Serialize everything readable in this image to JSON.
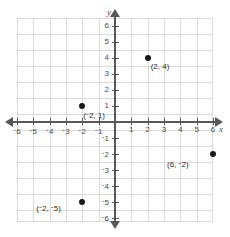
{
  "figure": {
    "type": "coordinate-plane",
    "x_axis_name": "x",
    "y_axis_name": "y"
  },
  "axes": {
    "x_ticks": [
      {
        "value": -6,
        "label": "6",
        "negative": true
      },
      {
        "value": -5,
        "label": "5",
        "negative": true
      },
      {
        "value": -4,
        "label": "4",
        "negative": true
      },
      {
        "value": -3,
        "label": "3",
        "negative": true
      },
      {
        "value": -2,
        "label": "2",
        "negative": true
      },
      {
        "value": -1,
        "label": "1",
        "negative": true
      },
      {
        "value": 1,
        "label": "1",
        "negative": false
      },
      {
        "value": 2,
        "label": "2",
        "negative": false
      },
      {
        "value": 3,
        "label": "3",
        "negative": false
      },
      {
        "value": 4,
        "label": "4",
        "negative": false
      },
      {
        "value": 5,
        "label": "5",
        "negative": false
      },
      {
        "value": 6,
        "label": "6",
        "negative": false
      }
    ],
    "y_ticks": [
      {
        "value": 6,
        "label": "6",
        "negative": false
      },
      {
        "value": 5,
        "label": "5",
        "negative": false
      },
      {
        "value": 4,
        "label": "4",
        "negative": false
      },
      {
        "value": 3,
        "label": "3",
        "negative": false
      },
      {
        "value": 2,
        "label": "2",
        "negative": false
      },
      {
        "value": 1,
        "label": "1",
        "negative": false
      },
      {
        "value": -1,
        "label": "1",
        "negative": true
      },
      {
        "value": -2,
        "label": "2",
        "negative": true
      },
      {
        "value": -3,
        "label": "3",
        "negative": true
      },
      {
        "value": -4,
        "label": "4",
        "negative": true
      },
      {
        "value": -5,
        "label": "5",
        "negative": true
      },
      {
        "value": -6,
        "label": "6",
        "negative": true
      }
    ]
  },
  "chart_data": {
    "type": "scatter",
    "title": "",
    "xlabel": "x",
    "ylabel": "y",
    "xlim": [
      -6,
      6
    ],
    "ylim": [
      -6,
      6
    ],
    "grid": true,
    "legend": "none",
    "points": [
      {
        "x": 2,
        "y": 4,
        "label": "(2, 4)"
      },
      {
        "x": -2,
        "y": 1,
        "label": "(-2, 1)"
      },
      {
        "x": 6,
        "y": -2,
        "label": "(6, -2)"
      },
      {
        "x": -2,
        "y": -5,
        "label": "(-2, -5)"
      }
    ]
  },
  "point_labels": {
    "p1": {
      "open": "(",
      "x": "2",
      "sep": ", ",
      "y": "4",
      "close": ")"
    },
    "p2": {
      "open": "(",
      "x": "2",
      "sep": ", ",
      "y": "1",
      "close": ")"
    },
    "p3": {
      "open": "(",
      "x": "6",
      "sep": ", ",
      "y": "2",
      "close": ")"
    },
    "p4": {
      "open": "(",
      "x": "2",
      "sep": ", ",
      "y": "5",
      "close": ")"
    }
  },
  "colors": {
    "grid": "#d9d9d9",
    "axis": "#58585a",
    "point": "#1a1a1a",
    "text": "#4a4a4c",
    "background": "#ffffff"
  }
}
